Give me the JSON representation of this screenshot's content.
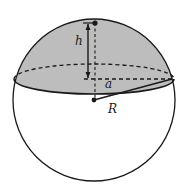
{
  "diagram": {
    "labels": {
      "height": "h",
      "base_radius": "a",
      "sphere_radius": "R"
    },
    "colors": {
      "cap_fill": "#bdbdbd",
      "stroke": "#1a1a1a",
      "background": "#ffffff"
    }
  }
}
